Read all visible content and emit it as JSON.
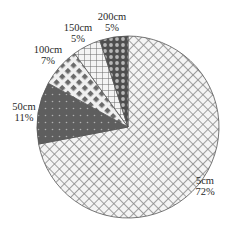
{
  "chart_data": {
    "type": "pie",
    "title": "",
    "start_angle_deg": 90,
    "direction": "clockwise",
    "slices": [
      {
        "label": "5cm",
        "percent_label": "72%",
        "value": 72,
        "pattern": "crosshatch-diagonal-light"
      },
      {
        "label": "50cm",
        "percent_label": "11%",
        "value": 11,
        "pattern": "dark-dotted"
      },
      {
        "label": "100cm",
        "percent_label": "7%",
        "value": 7,
        "pattern": "diamond-checker"
      },
      {
        "label": "150cm",
        "percent_label": "5%",
        "value": 5,
        "pattern": "square-grid"
      },
      {
        "label": "200cm",
        "percent_label": "5%",
        "value": 5,
        "pattern": "dark-circles"
      }
    ],
    "legend": "none (labels placed outside slices)"
  },
  "colors": {
    "outline": "#555555",
    "hatch": "#8a8a8a",
    "dark_fill": "#5e5e5e",
    "text": "#2a2a2a"
  }
}
